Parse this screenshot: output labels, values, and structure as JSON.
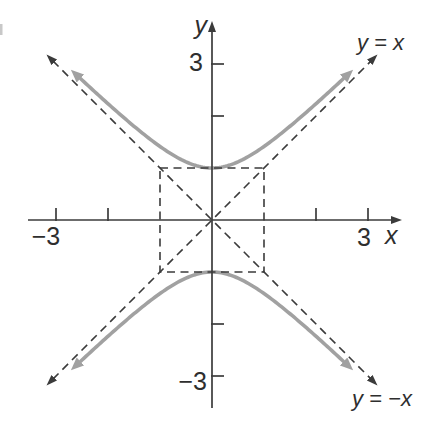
{
  "chart_data": {
    "type": "line",
    "xlabel": "x",
    "ylabel": "y",
    "xlim": [
      -3.55,
      3.7
    ],
    "ylim": [
      -3.85,
      3.85
    ],
    "grid": false,
    "background": "#ffffff",
    "axis_color": "#3b3b3b",
    "xticks": [
      -3,
      -2,
      2,
      3
    ],
    "yticks": [
      -3,
      -2,
      2,
      3
    ],
    "xtick_labels": {
      "-3": "−3",
      "3": "3"
    },
    "ytick_labels": {
      "-3": "−3",
      "3": "3"
    },
    "series": [
      {
        "name": "hyperbola-upper-branch",
        "kind": "hyperbola",
        "equation": "y = sqrt(1 + x^2)",
        "branch": 1,
        "x_range": [
          -2.58,
          2.58
        ],
        "color": "#a1a1a1",
        "width": 3.6,
        "dashed": false,
        "arrows": "both"
      },
      {
        "name": "hyperbola-lower-branch",
        "kind": "hyperbola",
        "equation": "y = -sqrt(1 + x^2)",
        "branch": -1,
        "x_range": [
          -2.58,
          2.58
        ],
        "color": "#a1a1a1",
        "width": 3.6,
        "dashed": false,
        "arrows": "both"
      },
      {
        "name": "asymptote-y-equals-x",
        "kind": "line",
        "equation": "y = x",
        "slope": 1,
        "intercept": 0,
        "label": "y = x",
        "x_range": [
          -3.06,
          3.06
        ],
        "color": "#3b3b3b",
        "width": 1.6,
        "dashed": true,
        "arrows": "both"
      },
      {
        "name": "asymptote-y-equals-neg-x",
        "kind": "line",
        "equation": "y = -x",
        "slope": -1,
        "intercept": 0,
        "label": "y = −x",
        "x_range": [
          -3.06,
          3.06
        ],
        "color": "#3b3b3b",
        "width": 1.6,
        "dashed": true,
        "arrows": "both"
      }
    ],
    "shapes": [
      {
        "name": "central-rectangle",
        "type": "rect",
        "x_range": [
          -1,
          1
        ],
        "y_range": [
          -1,
          1
        ],
        "color": "#3b3b3b",
        "width": 1.6,
        "dashed": true
      }
    ]
  }
}
